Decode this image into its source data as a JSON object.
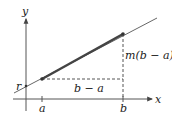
{
  "diagram": {
    "axes": {
      "x_label": "x",
      "y_label": "y"
    },
    "labels": {
      "intercept": "r",
      "run": "b − a",
      "rise": "m(b − a)",
      "tick_a": "a",
      "tick_b": "b"
    },
    "colors": {
      "axis": "#555555",
      "line": "#555555",
      "segment": "#444444",
      "dashed": "#555555",
      "text": "#222222"
    }
  }
}
